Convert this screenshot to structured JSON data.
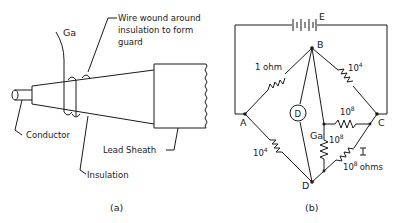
{
  "figure_a": {
    "caption": "(a)",
    "labels": {
      "ga": "Ga",
      "wire_line1": "Wire wound around",
      "wire_line2": "insulation to form",
      "wire_line3": "guard",
      "conductor": "Conductor",
      "insulation": "Insulation",
      "lead_sheath": "Lead Sheath"
    }
  },
  "figure_b": {
    "caption": "(b)",
    "nodes": {
      "a": "A",
      "b": "B",
      "c": "C",
      "d": "D"
    },
    "battery": "E",
    "detector": "D",
    "resistors": {
      "ab": "1 ohm",
      "bc_base": "10",
      "bc_exp": "4",
      "ad_base": "10",
      "ad_exp": "4",
      "gc_base": "10",
      "gc_exp": "8",
      "gd_base": "10",
      "gd_exp": "8",
      "cd_base": "10",
      "cd_exp": "8",
      "cd_unit": "ohms"
    },
    "guard_label": "Ga"
  }
}
